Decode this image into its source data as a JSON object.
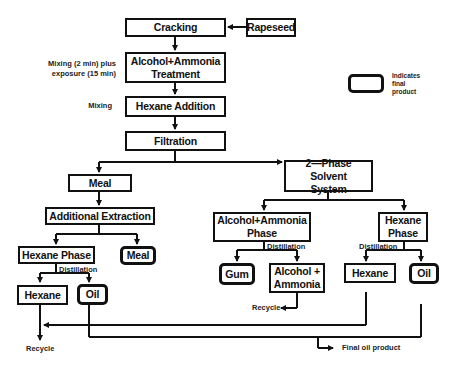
{
  "diagram": {
    "type": "process-flowchart",
    "nodes": {
      "cracking": "Cracking",
      "rapeseed": "Rapeseed",
      "treatment_line1": "Alcohol+Ammonia",
      "treatment_line2": "Treatment",
      "hexane_addition": "Hexane Addition",
      "filtration": "Filtration",
      "meal": "Meal",
      "two_phase_line1": "2—Phase Solvent",
      "two_phase_line2": "System",
      "additional_extraction": "Additional Extraction",
      "alc_phase_line1": "Alcohol+Ammonia",
      "alc_phase_line2": "Phase",
      "hex_phase_line1": "Hexane",
      "hex_phase_line2": "Phase",
      "left_hexane_phase": "Hexane Phase",
      "left_meal_final": "Meal",
      "left_hexane": "Hexane",
      "left_oil_final": "Oil",
      "gum_final": "Gum",
      "alc_recovered_line1": "Alcohol +",
      "alc_recovered_line2": "Ammonia",
      "right_hexane": "Hexane",
      "right_oil_final": "Oil"
    },
    "annotations": {
      "mixing_exposure_line1": "Mixing (2 min) plus",
      "mixing_exposure_line2": "exposure (15 min)",
      "mixing": "Mixing",
      "distillation_left": "Distillation",
      "distillation_mid": "Distillation",
      "distillation_right": "Distillation",
      "recycle_mid": "Recycle",
      "recycle_left": "Recycle",
      "final_oil_product": "Final oil product"
    },
    "legend": {
      "line1": "Indicates",
      "line2": "final",
      "line3": "product"
    }
  }
}
